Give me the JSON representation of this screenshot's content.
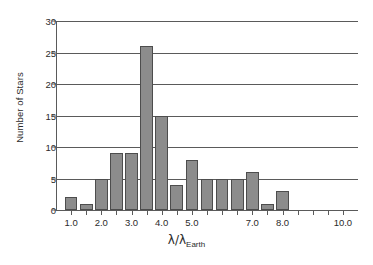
{
  "chart_data": {
    "type": "bar",
    "title": "",
    "subtitle": "",
    "xlabel": "λ/λ Earth",
    "xlabel_main": "λ/λ",
    "xlabel_sub": "Earth",
    "ylabel": "Number of Stars",
    "xlim": [
      0.5,
      10.5
    ],
    "ylim": [
      0,
      30
    ],
    "grid": true,
    "legend": false,
    "legend_position": "none",
    "bar_color": "#8c8c8c",
    "bar_edge_color": "#4d4d4d",
    "axis_color": "#5a5a5a",
    "bin_width": 0.5,
    "categories": [
      "1.0",
      "1.5",
      "2.0",
      "2.5",
      "3.0",
      "3.5",
      "4.0",
      "4.5",
      "5.0",
      "5.5",
      "6.0",
      "6.5",
      "7.0",
      "7.5",
      "8.0",
      "8.5",
      "9.0",
      "9.5",
      "10.0"
    ],
    "x": [
      1.0,
      1.5,
      2.0,
      2.5,
      3.0,
      3.5,
      4.0,
      4.5,
      5.0,
      5.5,
      6.0,
      6.5,
      7.0,
      7.5,
      8.0,
      8.5,
      9.0,
      9.5,
      10.0
    ],
    "values": [
      2,
      1,
      5,
      9,
      9,
      26,
      15,
      4,
      8,
      5,
      5,
      5,
      6,
      1,
      3,
      0,
      0,
      0,
      0
    ],
    "xticks": [
      1.0,
      1.5,
      2.0,
      2.5,
      3.0,
      3.5,
      4.0,
      4.5,
      5.0,
      5.5,
      6.0,
      6.5,
      7.0,
      7.5,
      8.0,
      8.5,
      9.0,
      9.5,
      10.0
    ],
    "xtick_labels": [
      "1.0",
      "",
      "2.0",
      "",
      "3.0",
      "",
      "4.0",
      "",
      "5.0",
      "",
      "",
      "",
      "7.0",
      "",
      "8.0",
      "",
      "",
      "",
      "10.0"
    ],
    "yticks": [
      0,
      5,
      10,
      15,
      20,
      25,
      30
    ],
    "ytick_labels": [
      "0",
      "5",
      "10",
      "15",
      "20",
      "25",
      "30"
    ]
  }
}
